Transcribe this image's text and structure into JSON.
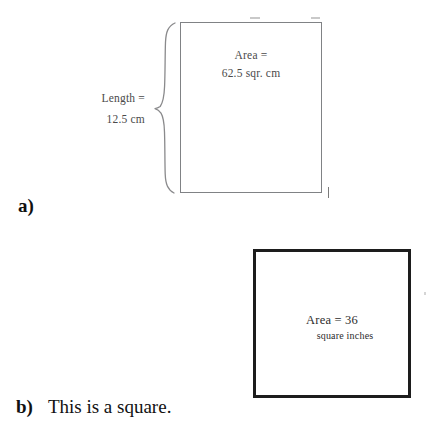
{
  "worksheet": {
    "items": [
      {
        "marker": "a)",
        "shape": "rectangle",
        "side_label": {
          "line1": "Length =",
          "line2": "12.5 cm"
        },
        "inside_label": {
          "line1": "Area =",
          "line2": "62.5 sqr. cm"
        },
        "brace": "curly-brace-left"
      },
      {
        "marker": "b)",
        "shape": "square",
        "caption": "This is a square.",
        "inside_label": {
          "line1": "Area = 36",
          "line2": "square inches"
        }
      }
    ]
  },
  "colors": {
    "background": "#ffffff",
    "rectangle_stroke": "#808285",
    "square_stroke": "#1d1d1d",
    "text_gray": "#4a4a4a",
    "text_dark": "#111111"
  }
}
